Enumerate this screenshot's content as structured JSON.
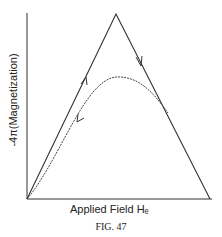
{
  "figure": {
    "ylabel": "-4π(Magnetization)",
    "xlabel": "Applied Field Hₑ",
    "caption": "FIG. 47"
  },
  "diagram": {
    "curves": [
      {
        "name": "ascending-line",
        "style": "solid",
        "direction": "up"
      },
      {
        "name": "descending-line",
        "style": "solid",
        "direction": "down"
      },
      {
        "name": "return-curve",
        "style": "dashed",
        "direction": "down-left"
      }
    ]
  }
}
